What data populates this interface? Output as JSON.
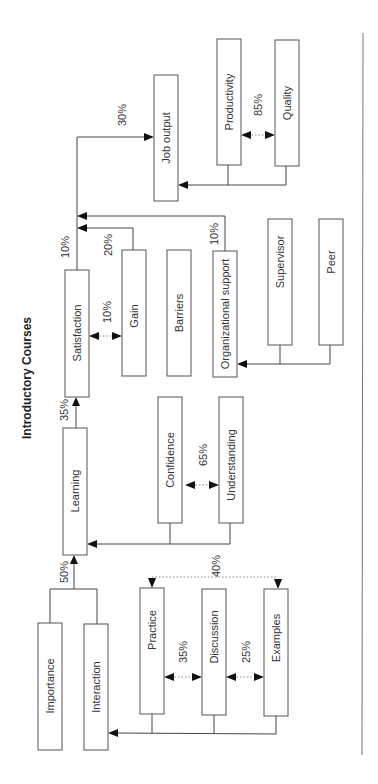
{
  "title": "Introductory Courses",
  "nodes": {
    "importance": "Importance",
    "interaction": "Interaction",
    "practice": "Practice",
    "discussion": "Discussion",
    "examples": "Examples",
    "learning": "Learning",
    "confidence": "Confidence",
    "understanding": "Understanding",
    "satisfaction": "Satisfaction",
    "gain": "Gain",
    "barriers": "Barriers",
    "organizational_support": "Organizational support",
    "supervisor": "Supervisor",
    "peer": "Peer",
    "job_output": "Job output",
    "productivity": "Productivity",
    "quality": "Quality"
  },
  "weights": {
    "to_learning": "50%",
    "learning_to_satisfaction": "35%",
    "satisfaction_to_job_output": "10%",
    "gain_to_job_output": "20%",
    "org_support_to_job_output": "10%",
    "job_output_top": "30%",
    "practice_discussion": "35%",
    "discussion_examples": "25%",
    "practice_examples": "40%",
    "confidence_understanding": "65%",
    "satisfaction_gain": "10%",
    "productivity_quality": "85%"
  },
  "colors": {
    "box_stroke": "#555555",
    "line": "#444444",
    "arrow": "#111111",
    "text": "#333333"
  }
}
